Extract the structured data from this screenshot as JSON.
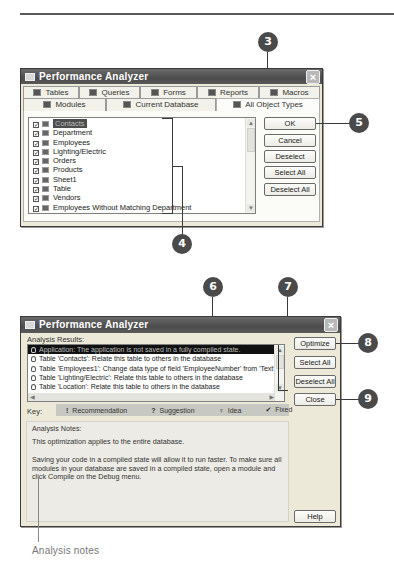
{
  "callouts": {
    "c3": "3",
    "c4": "4",
    "c5": "5",
    "c6": "6",
    "c7": "7",
    "c8": "8",
    "c9": "9"
  },
  "dialog1": {
    "title": "Performance Analyzer",
    "close_glyph": "×",
    "tabs_row1": [
      {
        "label": "Tables",
        "icon": "table-icon"
      },
      {
        "label": "Queries",
        "icon": "query-icon"
      },
      {
        "label": "Forms",
        "icon": "form-icon"
      },
      {
        "label": "Reports",
        "icon": "report-icon"
      },
      {
        "label": "Macros",
        "icon": "macro-icon"
      }
    ],
    "tabs_row2": [
      {
        "label": "Modules",
        "icon": "module-icon"
      },
      {
        "label": "Current Database",
        "icon": "database-icon"
      },
      {
        "label": "All Object Types",
        "icon": "all-objects-icon",
        "active": true
      }
    ],
    "objects": [
      {
        "name": "Contacts",
        "checked": true,
        "selected": true
      },
      {
        "name": "Department",
        "checked": true
      },
      {
        "name": "Employees",
        "checked": true
      },
      {
        "name": "Lighting/Electric",
        "checked": true
      },
      {
        "name": "Orders",
        "checked": true
      },
      {
        "name": "Products",
        "checked": true
      },
      {
        "name": "Sheet1",
        "checked": true
      },
      {
        "name": "Table",
        "checked": true
      },
      {
        "name": "Vendors",
        "checked": true
      },
      {
        "name": "Employees Without Matching Department",
        "checked": true
      }
    ],
    "check_glyph": "✓",
    "buttons": {
      "ok": "OK",
      "cancel": "Cancel",
      "deselect": "Deselect",
      "select_all": "Select All",
      "deselect_all": "Deselect All"
    },
    "scroll_up": "▲",
    "scroll_down": "▼"
  },
  "dialog2": {
    "title": "Performance Analyzer",
    "close_glyph": "×",
    "results_label": "Analysis Results:",
    "results": [
      {
        "text": "Application: The application is not saved in a fully compiled state.",
        "selected": true
      },
      {
        "text": "Table 'Contacts': Relate this table to others in the database"
      },
      {
        "text": "Table 'Employees1': Change data type of field 'EmployeeNumber' from 'Text' to 'Long Intege"
      },
      {
        "text": "Table 'Lighting/Electric': Relate this table to others in the database"
      },
      {
        "text": "Table 'Location': Relate this table to others in the database"
      },
      {
        "text": "Table 'Sheet': Relate this table to others in the database"
      }
    ],
    "buttons": {
      "optimize": "Optimize",
      "select_all": "Select All",
      "deselect_all": "Deselect All",
      "close": "Close",
      "help": "Help"
    },
    "key": {
      "label": "Key:",
      "items": [
        {
          "glyph": "!",
          "label": "Recommendation"
        },
        {
          "glyph": "?",
          "label": "Suggestion"
        },
        {
          "glyph": "♀",
          "label": "Idea"
        },
        {
          "glyph": "✔",
          "label": "Fixed"
        }
      ]
    },
    "notes": {
      "label": "Analysis Notes:",
      "line1": "This optimization applies to the entire database.",
      "line2": "Saving your code in a compiled state will allow it to run faster. To make sure all modules in your database are saved in a compiled state, open a module and click Compile on the Debug menu."
    },
    "scroll_left": "◀",
    "scroll_right": "▶",
    "scroll_up": "▲",
    "scroll_down": "▼"
  },
  "caption": "Analysis notes"
}
